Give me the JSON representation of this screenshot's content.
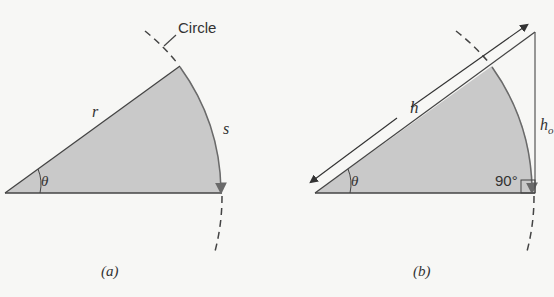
{
  "figure": {
    "panel_a": {
      "caption": "(a)",
      "circle_label": "Circle",
      "radius_label": "r",
      "arc_label": "s",
      "angle_label": "θ"
    },
    "panel_b": {
      "caption": "(b)",
      "hypotenuse_label": "h",
      "opposite_label": "h",
      "opposite_label_subscript": "o",
      "angle_label": "θ",
      "right_angle_label": "90°"
    },
    "colors": {
      "background": "#f7f7f5",
      "sector_fill": "#c9c9c9",
      "line": "#444444",
      "arc": "#6a6a6a"
    }
  }
}
